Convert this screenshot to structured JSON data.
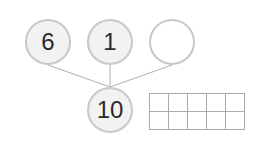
{
  "number_bond": {
    "parts": [
      {
        "value": "6",
        "filled": true
      },
      {
        "value": "1",
        "filled": true
      },
      {
        "value": "",
        "filled": false
      }
    ],
    "whole": {
      "value": "10",
      "filled": true
    }
  },
  "ten_frame": {
    "rows": 2,
    "columns": 5,
    "filled_cells": 0
  },
  "colors": {
    "circle_border": "#c8c8c8",
    "circle_fill": "#f2f2f2",
    "line": "#b0b0b0",
    "grid": "#aaaaaa"
  }
}
